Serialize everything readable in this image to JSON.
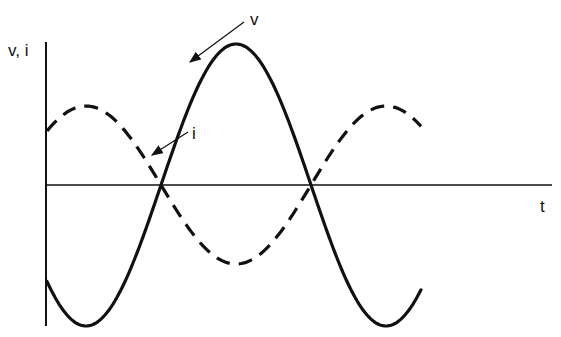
{
  "diagram": {
    "axis_labels": {
      "y": "v, i",
      "x": "t"
    },
    "curves": [
      {
        "id": "v",
        "label": "v",
        "style": "solid",
        "relative_amplitude": 1.0,
        "phase_deg": -90,
        "periods_shown": 1.25
      },
      {
        "id": "i",
        "label": "i",
        "style": "dashed",
        "relative_amplitude": 0.56,
        "phase_deg": 0,
        "periods_shown": 1.25
      }
    ],
    "stroke_color": "#111111"
  }
}
